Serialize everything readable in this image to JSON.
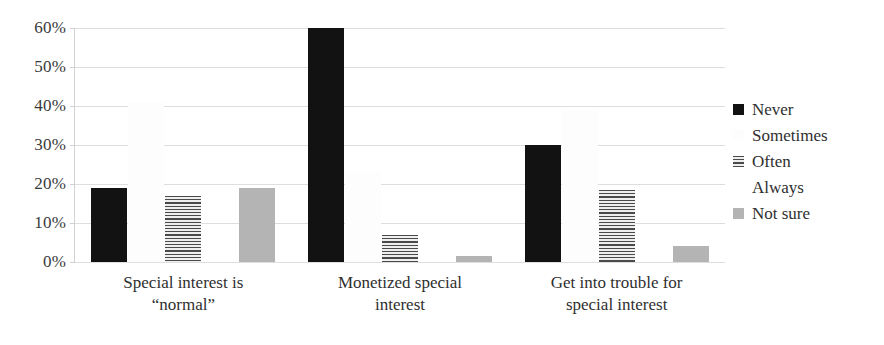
{
  "chart_data": {
    "type": "bar",
    "title": "",
    "subtitle": "",
    "xlabel": "",
    "ylabel": "",
    "ylim": [
      0,
      60
    ],
    "ytick_labels": [
      "60%",
      "50%",
      "40%",
      "30%",
      "20%",
      "10%",
      "0%"
    ],
    "ytick_values": [
      60,
      50,
      40,
      30,
      20,
      10,
      0
    ],
    "grid": true,
    "legend_position": "right",
    "categories": [
      "Special interest is “normal”",
      "Monetized special interest",
      "Get into trouble for special interest"
    ],
    "category_lines": [
      [
        "Special interest is",
        "“normal”"
      ],
      [
        "Monetized special",
        "interest"
      ],
      [
        "Get into trouble for",
        "special interest"
      ]
    ],
    "series": [
      {
        "name": "Never",
        "pattern": "solid-black",
        "color": "#121212",
        "values": [
          19,
          60,
          30
        ]
      },
      {
        "name": "Sometimes",
        "pattern": "light-dots",
        "color": "#e8e8e8",
        "values": [
          41,
          23,
          39
        ]
      },
      {
        "name": "Often",
        "pattern": "horizontal-lines",
        "color": "#4a4a4a",
        "values": [
          17,
          7,
          18.5
        ]
      },
      {
        "name": "Always",
        "pattern": "faint-dots",
        "color": "#f4f4f4",
        "values": [
          4.5,
          2,
          8
        ]
      },
      {
        "name": "Not sure",
        "pattern": "solid-gray",
        "color": "#b4b4b4",
        "values": [
          19,
          1.5,
          4
        ]
      }
    ]
  },
  "legend": {
    "items": [
      {
        "label": "Never",
        "swatch": "swatch-never"
      },
      {
        "label": "Sometimes",
        "swatch": "swatch-sometimes"
      },
      {
        "label": "Often",
        "swatch": "swatch-often"
      },
      {
        "label": "Always",
        "swatch": "swatch-always"
      },
      {
        "label": "Not sure",
        "swatch": "swatch-not-sure"
      }
    ]
  }
}
